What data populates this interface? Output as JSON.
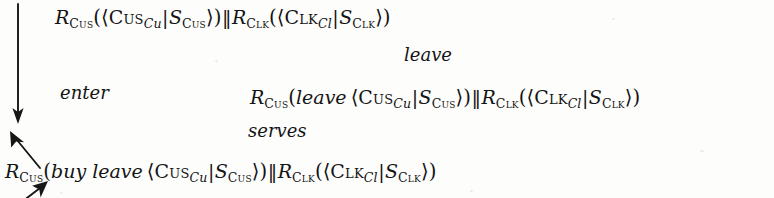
{
  "diagram": {
    "type": "transition-derivation",
    "expressions": [
      {
        "id": "top",
        "text": "R_Cus(<Cus_Cu|S_Cus>) || R_Clk(<Clk_Cl|S_Clk>)",
        "parts": {
          "r1": "R",
          "r1_sub": "Cus",
          "agent1": "Cus",
          "agent1_sub": "Cu",
          "store1": "S",
          "store1_sub": "Cus",
          "r2": "R",
          "r2_sub": "Clk",
          "agent2": "Clk",
          "agent2_sub": "Cl",
          "store2": "S",
          "store2_sub": "Clk",
          "prefix1": "",
          "parallel": "‖",
          "open_paren": "(",
          "close_paren": ")",
          "open_angle": "⟨",
          "close_angle": "⟩",
          "bar": "|"
        }
      },
      {
        "id": "middle",
        "text": "R_Cus(leave <Cus_Cu|S_Cus>) || R_Clk(<Clk_Cl|S_Clk>)",
        "parts": {
          "r1": "R",
          "r1_sub": "Cus",
          "agent1": "Cus",
          "agent1_sub": "Cu",
          "store1": "S",
          "store1_sub": "Cus",
          "r2": "R",
          "r2_sub": "Clk",
          "agent2": "Clk",
          "agent2_sub": "Cl",
          "store2": "S",
          "store2_sub": "Clk",
          "prefix1": "leave",
          "parallel": "‖",
          "open_paren": "(",
          "close_paren": ")",
          "open_angle": "⟨",
          "close_angle": "⟩",
          "bar": "|"
        }
      },
      {
        "id": "bottom",
        "text": "R_Cus(buy leave <Cus_Cu|S_Cus>) || R_Clk(<Clk_Cl|S_Clk>)",
        "parts": {
          "r1": "R",
          "r1_sub": "Cus",
          "agent1": "Cus",
          "agent1_sub": "Cu",
          "store1": "S",
          "store1_sub": "Cus",
          "r2": "R",
          "r2_sub": "Clk",
          "agent2": "Clk",
          "agent2_sub": "Cl",
          "store2": "S",
          "store2_sub": "Clk",
          "prefix1": "buy leave",
          "parallel": "‖",
          "open_paren": "(",
          "close_paren": ")",
          "open_angle": "⟨",
          "close_angle": "⟩",
          "bar": "|"
        }
      }
    ],
    "transitions": [
      {
        "id": "enter",
        "label": "enter",
        "direction": "down",
        "from": "top",
        "to": "bottom"
      },
      {
        "id": "serves",
        "label": "serves",
        "direction": "up-right",
        "from": "bottom",
        "to": "middle"
      },
      {
        "id": "leave",
        "label": "leave",
        "direction": "up-left",
        "from": "middle",
        "to": "top"
      }
    ],
    "colors": {
      "ink": "#141414",
      "background": "#fdfdfc"
    }
  }
}
